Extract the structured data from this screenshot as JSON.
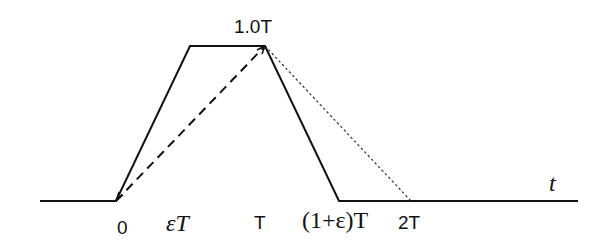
{
  "diagram": {
    "type": "waveform",
    "colors": {
      "line": "#111111",
      "background": "#ffffff"
    },
    "axis_label": "t",
    "peak_label": "1.0T",
    "tick_labels": {
      "zero": "0",
      "eps_T": "εT",
      "T": "T",
      "one_plus_eps_T": "(1+ε)T",
      "two_T": "2T"
    },
    "paths": {
      "solid_trapezoid": "M40,201 L116,201 L190,46 L265,46 L339,201 L578,201",
      "dashed_rise": "M116,201 L265,46",
      "dotted_fall": "M265,46 L411,201"
    }
  }
}
